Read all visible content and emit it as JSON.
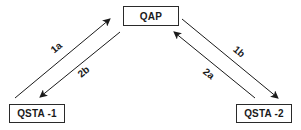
{
  "diagram": {
    "type": "message-flow",
    "nodes": {
      "qap": {
        "label": "QAP"
      },
      "qsta1": {
        "label": "QSTA -1"
      },
      "qsta2": {
        "label": "QSTA -2"
      }
    },
    "edges": [
      {
        "id": "1a",
        "label": "1a",
        "from": "QSTA -1",
        "to": "QAP"
      },
      {
        "id": "2b",
        "label": "2b",
        "from": "QAP",
        "to": "QSTA -1"
      },
      {
        "id": "1b",
        "label": "1b",
        "from": "QAP",
        "to": "QSTA -2"
      },
      {
        "id": "2a",
        "label": "2a",
        "from": "QSTA -2",
        "to": "QAP"
      }
    ],
    "colors": {
      "line": "#1a1a1a",
      "background": "#ffffff"
    }
  }
}
